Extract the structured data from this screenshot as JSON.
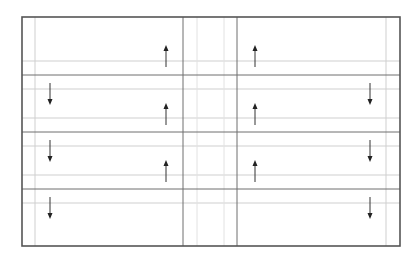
{
  "diagram": {
    "title": "",
    "rows": 4,
    "columns": [
      "left",
      "center",
      "right"
    ],
    "arrows": [
      {
        "row": 0,
        "slot": "left-inner",
        "direction": "up"
      },
      {
        "row": 0,
        "slot": "right-inner",
        "direction": "up"
      },
      {
        "row": 1,
        "slot": "left-outer",
        "direction": "down"
      },
      {
        "row": 1,
        "slot": "left-inner",
        "direction": "up"
      },
      {
        "row": 1,
        "slot": "right-inner",
        "direction": "up"
      },
      {
        "row": 1,
        "slot": "right-outer",
        "direction": "down"
      },
      {
        "row": 2,
        "slot": "left-outer",
        "direction": "down"
      },
      {
        "row": 2,
        "slot": "left-inner",
        "direction": "up"
      },
      {
        "row": 2,
        "slot": "right-inner",
        "direction": "up"
      },
      {
        "row": 2,
        "slot": "right-outer",
        "direction": "down"
      },
      {
        "row": 3,
        "slot": "left-outer",
        "direction": "down"
      },
      {
        "row": 3,
        "slot": "right-outer",
        "direction": "down"
      }
    ],
    "colors": {
      "border": "#555555",
      "dark_line": "#6e6e6e",
      "light_line": "#cfcfcf",
      "arrow": "#222222"
    }
  }
}
